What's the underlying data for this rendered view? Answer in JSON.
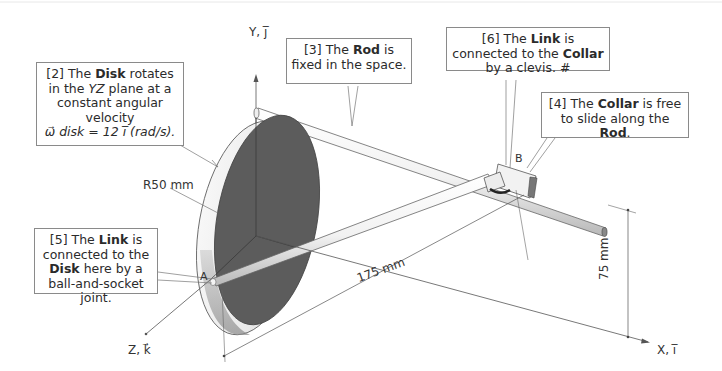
{
  "figure": {
    "type": "mechanism-diagram",
    "axes": {
      "y_label": "Y, j̅",
      "z_label": "Z, k⃗",
      "x_label": "X, i̅"
    },
    "points": {
      "a": "A",
      "b": "B"
    },
    "dimensions": {
      "radius": "R50 mm",
      "length": "175 mm",
      "height": "75 mm"
    },
    "callouts": [
      {
        "id": "2",
        "prefix": "[2] The ",
        "bold1": "Disk",
        "text1": " rotates in the ",
        "italic": "YZ",
        "text2": " plane at a constant angular velocity",
        "equation": "ω⃗ disk = 12 i̅ (rad/s)."
      },
      {
        "id": "3",
        "prefix": "[3] The ",
        "bold1": "Rod",
        "text1": " is fixed in the space."
      },
      {
        "id": "6",
        "prefix": "[6] The ",
        "bold1": "Link",
        "text1": " is connected to the ",
        "bold2": "Collar",
        "text2": " by a clevis. #"
      },
      {
        "id": "4",
        "prefix": "[4] The ",
        "bold1": "Collar",
        "text1": " is free to slide along the ",
        "bold2": "Rod",
        "text2": "."
      },
      {
        "id": "5",
        "prefix": "[5] The ",
        "bold1": "Link",
        "text1": " is connected to the ",
        "bold2": "Disk",
        "text2": " here by a ball-and-socket joint."
      }
    ],
    "colors": {
      "disk_face": "#5a5a5a",
      "disk_rim": "#f0f0f0",
      "rod": "#f4f4f4",
      "outline": "#555555",
      "callout_border": "#8a8a8a"
    }
  }
}
